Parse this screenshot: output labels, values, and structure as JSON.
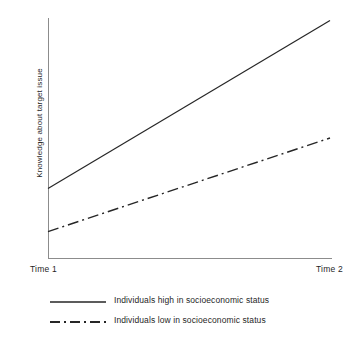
{
  "chart_data": {
    "type": "line",
    "title": "",
    "subtitle": "",
    "xlabel": "",
    "ylabel": "Knowledge about target issue",
    "x_tick_labels": [
      "Time 1",
      "Time 2"
    ],
    "y_tick_labels": [],
    "grid": false,
    "legend_position": "bottom",
    "x": [
      0,
      1
    ],
    "xlim": [
      0,
      1
    ],
    "ylim": [
      0,
      1
    ],
    "series": [
      {
        "name": "Individuals high in socioeconomic status",
        "style": "solid",
        "color": "#262626",
        "values": [
          0.29,
          0.99
        ]
      },
      {
        "name": "Individuals low in socioeconomic status",
        "style": "dash-dot",
        "color": "#262626",
        "values": [
          0.11,
          0.5
        ]
      }
    ],
    "annotations": []
  },
  "axes": {
    "y_label": "Knowledge about target issue",
    "x_tick_left": "Time 1",
    "x_tick_right": "Time 2",
    "axis_color": "#8c8c8c"
  },
  "legend": {
    "items": [
      {
        "label": "Individuals high in socioeconomic status",
        "line_style": "solid",
        "swatch_name": "solid-line-swatch"
      },
      {
        "label": "Individuals low in socioeconomic status",
        "line_style": "dash-dot",
        "swatch_name": "dash-dot-line-swatch"
      }
    ]
  }
}
